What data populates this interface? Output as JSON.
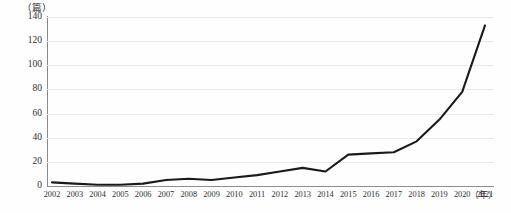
{
  "chart_data": {
    "type": "line",
    "title": "",
    "subtitle": "",
    "xlabel": "（年）",
    "ylabel": "（篇）",
    "ylim": [
      0,
      140
    ],
    "yticks": [
      0,
      20,
      40,
      60,
      80,
      100,
      120,
      140
    ],
    "grid": true,
    "legend": false,
    "legend_position": "none",
    "categories": [
      "2002",
      "2003",
      "2004",
      "2005",
      "2006",
      "2007",
      "2008",
      "2009",
      "2010",
      "2011",
      "2012",
      "2013",
      "2014",
      "2015",
      "2016",
      "2017",
      "2018",
      "2019",
      "2020",
      "2021"
    ],
    "x": [
      2002,
      2003,
      2004,
      2005,
      2006,
      2007,
      2008,
      2009,
      2010,
      2011,
      2012,
      2013,
      2014,
      2015,
      2016,
      2017,
      2018,
      2019,
      2020,
      2021
    ],
    "values": [
      3,
      2,
      1,
      1,
      2,
      5,
      6,
      5,
      7,
      9,
      12,
      15,
      12,
      26,
      27,
      28,
      37,
      55,
      78,
      133
    ],
    "series": [
      {
        "name": "论文数量",
        "color": "#1a1a1a",
        "values": [
          3,
          2,
          1,
          1,
          2,
          5,
          6,
          5,
          7,
          9,
          12,
          15,
          12,
          26,
          27,
          28,
          37,
          55,
          78,
          133
        ]
      }
    ],
    "annotations": []
  },
  "axes": {
    "y_unit_label": "（篇）",
    "x_unit_label": "（年）",
    "y_tick_labels": [
      "0",
      "20",
      "40",
      "60",
      "80",
      "100",
      "120",
      "140"
    ],
    "x_tick_labels": [
      "2002",
      "2003",
      "2004",
      "2005",
      "2006",
      "2007",
      "2008",
      "2009",
      "2010",
      "2011",
      "2012",
      "2013",
      "2014",
      "2015",
      "2016",
      "2017",
      "2018",
      "2019",
      "2020",
      "2021"
    ]
  },
  "colors": {
    "line": "#1a1a1a",
    "gridline": "#e9e9e9",
    "axis": "#8a8a8a",
    "text": "#2e2e2e",
    "background": "#fefefe"
  }
}
